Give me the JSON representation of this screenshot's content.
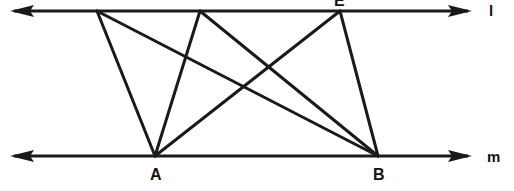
{
  "figure": {
    "width": 514,
    "height": 191,
    "background_color": "#ffffff",
    "ink_color": "#1a1a1a"
  },
  "lines": {
    "top": {
      "name": "l",
      "label": "l",
      "y": 11,
      "x_start": 12,
      "x_end": 470,
      "arrow_left": true,
      "arrow_right": true
    },
    "bottom": {
      "name": "m",
      "label": "m",
      "y": 156,
      "x_start": 12,
      "x_end": 470,
      "arrow_left": true,
      "arrow_right": true
    }
  },
  "vertices": {
    "top_line_points": [
      {
        "id": "P1",
        "label": "C",
        "x": 97,
        "y": 11,
        "label_visible": false
      },
      {
        "id": "P2",
        "label": "D",
        "x": 200,
        "y": 11,
        "label_visible": false
      },
      {
        "id": "P3",
        "label": "E",
        "x": 340,
        "y": 11,
        "label_visible": true
      }
    ],
    "bottom_line_points": [
      {
        "id": "A",
        "label": "A",
        "x": 155,
        "y": 156,
        "label_visible": true
      },
      {
        "id": "B",
        "label": "B",
        "x": 378,
        "y": 156,
        "label_visible": true
      }
    ]
  },
  "segments": [
    {
      "from": "P1",
      "to": "A",
      "x1": 97,
      "y1": 11,
      "x2": 155,
      "y2": 156
    },
    {
      "from": "P1",
      "to": "B",
      "x1": 97,
      "y1": 11,
      "x2": 378,
      "y2": 156
    },
    {
      "from": "P2",
      "to": "A",
      "x1": 200,
      "y1": 11,
      "x2": 155,
      "y2": 156
    },
    {
      "from": "P2",
      "to": "B",
      "x1": 200,
      "y1": 11,
      "x2": 378,
      "y2": 156
    },
    {
      "from": "P3",
      "to": "A",
      "x1": 340,
      "y1": 11,
      "x2": 155,
      "y2": 156
    },
    {
      "from": "P3",
      "to": "B",
      "x1": 340,
      "y1": 11,
      "x2": 378,
      "y2": 156
    }
  ],
  "labels": {
    "top_line_name": "l",
    "bottom_line_name": "m",
    "point_a": "A",
    "point_b": "B",
    "point_e": "E"
  }
}
